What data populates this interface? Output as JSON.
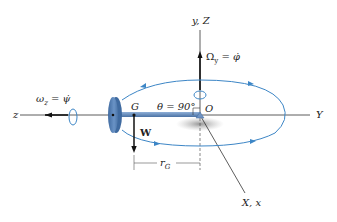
{
  "labels": {
    "y_Z": "y, Z",
    "omega_y": "Ω",
    "omega_y_sub": "y",
    "omega_y_eq": " = φ̇",
    "omega_z": "ω",
    "omega_z_sub": "z",
    "omega_z_eq": " = ψ̇",
    "z_axis": "z",
    "G": "G",
    "theta": "θ = 90°",
    "O": "O",
    "Y_axis": "Y",
    "W": "W",
    "r": "r",
    "r_sub": "G",
    "X_x": "X, x"
  },
  "colors": {
    "orbit": "#3d86c6",
    "disk": "#5f86b8",
    "rod": "#6f93c2",
    "axis": "#333333",
    "shadow": "#9a9a9a"
  }
}
